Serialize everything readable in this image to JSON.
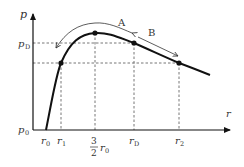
{
  "diagram": {
    "axes": {
      "y_label": "p",
      "x_label": "r",
      "origin_label": "p",
      "origin_sub": "0"
    },
    "y_ticks": [
      {
        "label": "p",
        "sub": "D"
      }
    ],
    "x_ticks": [
      {
        "label": "r",
        "sub": "0"
      },
      {
        "label": "r",
        "sub": "1"
      },
      {
        "frac_num": "3",
        "frac_den": "2",
        "label": "r",
        "sub": "0"
      },
      {
        "label": "r",
        "sub": "D"
      },
      {
        "label": "r",
        "sub": "2"
      }
    ],
    "regions": [
      {
        "label": "A"
      },
      {
        "label": "B"
      }
    ],
    "colors": {
      "curve": "#111111",
      "dashed": "#666666",
      "text": "#333333"
    }
  }
}
